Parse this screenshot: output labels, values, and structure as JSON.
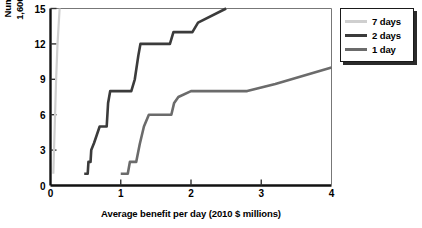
{
  "chart_data": {
    "type": "line",
    "title": "",
    "xlabel": "Average benefit per day (2010 $ millions)",
    "ylabel": "Number of additional\n1,600-gallon scoopers",
    "xlim": [
      0,
      4
    ],
    "ylim": [
      0,
      15
    ],
    "xticks": [
      0,
      1,
      2,
      3,
      4
    ],
    "xtick_labels": [
      "0",
      "1",
      "2",
      "3",
      "4"
    ],
    "yticks": [
      0,
      3,
      6,
      9,
      12,
      15
    ],
    "ytick_labels": [
      "0",
      "3",
      "6",
      "9",
      "12",
      "15"
    ],
    "grid": false,
    "legend_position": "outside-right-top",
    "series": [
      {
        "name": "7 days",
        "color": "#cfcfcf",
        "points": [
          [
            0.04,
            1.0
          ],
          [
            0.05,
            3.0
          ],
          [
            0.06,
            5.0
          ],
          [
            0.07,
            7.0
          ],
          [
            0.08,
            9.0
          ],
          [
            0.09,
            10.5
          ],
          [
            0.1,
            12.0
          ],
          [
            0.115,
            13.5
          ],
          [
            0.13,
            15.0
          ]
        ]
      },
      {
        "name": "2 days",
        "color": "#3b3b3b",
        "points": [
          [
            0.48,
            1.0
          ],
          [
            0.53,
            1.0
          ],
          [
            0.54,
            2.0
          ],
          [
            0.57,
            2.0
          ],
          [
            0.58,
            3.0
          ],
          [
            0.62,
            3.6
          ],
          [
            0.66,
            4.3
          ],
          [
            0.7,
            5.0
          ],
          [
            0.8,
            5.0
          ],
          [
            0.82,
            7.0
          ],
          [
            0.85,
            8.0
          ],
          [
            1.15,
            8.0
          ],
          [
            1.2,
            9.0
          ],
          [
            1.25,
            11.0
          ],
          [
            1.28,
            12.0
          ],
          [
            1.7,
            12.0
          ],
          [
            1.75,
            13.0
          ],
          [
            2.02,
            13.0
          ],
          [
            2.1,
            13.8
          ],
          [
            2.5,
            15.0
          ]
        ]
      },
      {
        "name": "1 day",
        "color": "#6b6b6b",
        "points": [
          [
            1.0,
            1.0
          ],
          [
            1.1,
            1.0
          ],
          [
            1.13,
            2.0
          ],
          [
            1.22,
            2.0
          ],
          [
            1.27,
            3.5
          ],
          [
            1.33,
            5.0
          ],
          [
            1.4,
            6.0
          ],
          [
            1.72,
            6.0
          ],
          [
            1.76,
            7.0
          ],
          [
            1.82,
            7.5
          ],
          [
            2.0,
            8.0
          ],
          [
            2.8,
            8.0
          ],
          [
            3.2,
            8.6
          ],
          [
            4.0,
            10.0
          ]
        ]
      }
    ]
  },
  "legend": {
    "items": [
      {
        "label": "7 days",
        "color": "#cfcfcf"
      },
      {
        "label": "2 days",
        "color": "#3b3b3b"
      },
      {
        "label": "1 day",
        "color": "#6b6b6b"
      }
    ]
  },
  "axes": {
    "frame_color": "#111111"
  }
}
